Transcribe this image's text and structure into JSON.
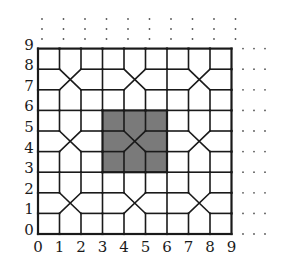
{
  "diagram": {
    "title": "",
    "grid": {
      "size": 9,
      "origin_px": [
        38,
        234
      ],
      "unit_px": [
        21.5,
        20.6
      ],
      "line_color": "#1a1a1a",
      "shade_color": "#7a7a7a",
      "background": "#ffffff"
    },
    "x_axis": {
      "labels": [
        "0",
        "1",
        "2",
        "3",
        "4",
        "5",
        "6",
        "7",
        "8",
        "9"
      ]
    },
    "y_axis": {
      "labels": [
        "0",
        "1",
        "2",
        "3",
        "4",
        "5",
        "6",
        "7",
        "8",
        "9"
      ]
    },
    "x_motifs": [
      {
        "cx": 1.5,
        "cy": 1.5,
        "shaded": false
      },
      {
        "cx": 4.5,
        "cy": 1.5,
        "shaded": false
      },
      {
        "cx": 7.5,
        "cy": 1.5,
        "shaded": false
      },
      {
        "cx": 1.5,
        "cy": 4.5,
        "shaded": false
      },
      {
        "cx": 4.5,
        "cy": 4.5,
        "shaded": true
      },
      {
        "cx": 7.5,
        "cy": 4.5,
        "shaded": false
      },
      {
        "cx": 1.5,
        "cy": 7.5,
        "shaded": false
      },
      {
        "cx": 4.5,
        "cy": 7.5,
        "shaded": false
      },
      {
        "cx": 7.5,
        "cy": 7.5,
        "shaded": false
      }
    ],
    "shaded_region": {
      "x0": 3,
      "y0": 3,
      "x1": 6,
      "y1": 6
    },
    "continuation_dots": {
      "top": {
        "columns": [
          0,
          1,
          2,
          3,
          4,
          5,
          6,
          7,
          8,
          9
        ],
        "rows_px": [
          19,
          29,
          39
        ]
      },
      "right": {
        "rows": [
          9,
          8,
          7,
          6,
          5,
          4,
          3,
          2,
          1,
          0
        ],
        "cols_px": [
          243,
          254,
          265
        ]
      },
      "color": "#555555"
    }
  }
}
